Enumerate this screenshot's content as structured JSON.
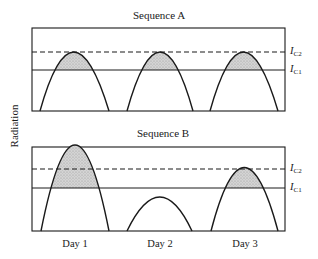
{
  "diagram": {
    "y_axis_label": "Radiation",
    "panels": [
      {
        "title": "Sequence A",
        "threshold_labels": {
          "ic2": "I",
          "ic2_sub": "C2",
          "ic1": "I",
          "ic1_sub": "C1"
        },
        "peaks": [
          "reaches I_C2",
          "reaches I_C2",
          "reaches I_C2"
        ]
      },
      {
        "title": "Sequence B",
        "threshold_labels": {
          "ic2": "I",
          "ic2_sub": "C2",
          "ic1": "I",
          "ic1_sub": "C1"
        },
        "peaks": [
          "exceeds I_C2",
          "below I_C1",
          "between I_C1 and I_C2"
        ]
      }
    ],
    "x_labels": [
      "Day 1",
      "Day 2",
      "Day 3"
    ],
    "colors": {
      "line": "#1a1a1a",
      "shade": "#c8c8c8",
      "background": "#ffffff"
    }
  }
}
